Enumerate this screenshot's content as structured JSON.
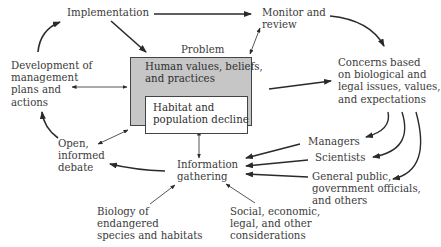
{
  "diagram": {
    "nodes": {
      "implementation": "Implementation",
      "monitor_review": [
        "Monitor and",
        "review"
      ],
      "problem_label": "Problem",
      "human_values": [
        "Human values, beliefs,",
        "and practices"
      ],
      "habitat_decline": [
        "Habitat and",
        "population decline"
      ],
      "development_plans": [
        "Development of",
        "management",
        "plans and",
        "actions"
      ],
      "concerns": [
        "Concerns based",
        "on biological and",
        "legal issues, values,",
        "and expectations"
      ],
      "open_debate": [
        "Open,",
        "informed",
        "debate"
      ],
      "information_gathering": [
        "Information",
        "gathering"
      ],
      "managers": "Managers",
      "scientists": "Scientists",
      "general_public": [
        "General public,",
        "government officials,",
        "and others"
      ],
      "biology": [
        "Biology of",
        "endangered",
        "species and habitats"
      ],
      "social": [
        "Social, economic,",
        "legal, and other",
        "considerations"
      ]
    },
    "colors": {
      "problem_box_fill": "#c6c6c6",
      "inner_box_fill": "#ffffff",
      "arrow": "#2a2a2a"
    }
  }
}
